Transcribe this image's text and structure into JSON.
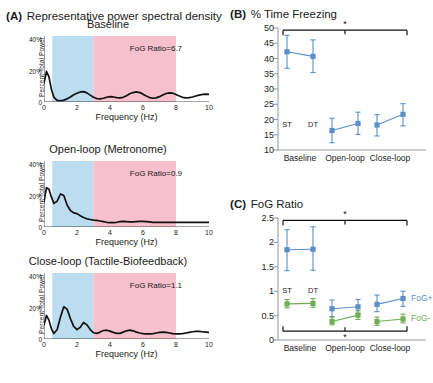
{
  "figure": {
    "panels": [
      "A",
      "B",
      "C"
    ]
  },
  "panelA": {
    "tag": "(A)",
    "title": "Representative power spectral density",
    "axis": {
      "xlabel": "Frequency (Hz)",
      "ylabel": "Percent Total Power",
      "xticks": [
        "0",
        "2",
        "4",
        "6",
        "8",
        "10"
      ],
      "yticks": [
        "0",
        "20%",
        "40%"
      ],
      "xlim": [
        0,
        10
      ],
      "ylim": [
        0,
        42
      ]
    },
    "bands": {
      "locomotor_color": "#bcdcf0",
      "freeze_color": "#f7c0cd",
      "locomotor_range": [
        0.5,
        3.0
      ],
      "freeze_range": [
        3.0,
        8.0
      ]
    },
    "plots": [
      {
        "title": "Baseline",
        "fog_label": "FoG Ratio=6.7",
        "fog_ratio": 6.7
      },
      {
        "title": "Open-loop (Metronome)",
        "fog_label": "FoG Ratio=0.9",
        "fog_ratio": 0.9
      },
      {
        "title": "Close-loop (Tactile-Biofeedback)",
        "fog_label": "FoG Ratio=1.1",
        "fog_ratio": 1.1
      }
    ]
  },
  "panelB": {
    "tag": "(B)",
    "title": "% Time Freezing",
    "significance_marker": "*"
  },
  "panelC": {
    "tag": "(C)",
    "title": "FoG Ratio",
    "significance_marker": "*",
    "legend": [
      {
        "label": "FoG+",
        "color": "#5b8fc9"
      },
      {
        "label": "FoG-",
        "color": "#6fae52"
      }
    ]
  },
  "chart_data": [
    {
      "id": "psd-baseline",
      "type": "line",
      "title": "Baseline",
      "xlabel": "Frequency (Hz)",
      "ylabel": "Percent Total Power",
      "xlim": [
        0,
        10
      ],
      "ylim": [
        0,
        42
      ],
      "xticks": [
        0,
        2,
        4,
        6,
        8,
        10
      ],
      "yticks": [
        0,
        20,
        40
      ],
      "ytick_labels": [
        "0",
        "20%",
        "40%"
      ],
      "grid": false,
      "annotations": [
        {
          "text": "FoG Ratio=6.7",
          "x": 5.2,
          "y": 34
        }
      ],
      "shaded_bands": [
        {
          "name": "locomotor",
          "x0": 0.5,
          "x1": 3.0,
          "color": "#bcdcf0"
        },
        {
          "name": "freeze",
          "x0": 3.0,
          "x1": 8.0,
          "color": "#f7c0cd"
        }
      ],
      "x": [
        0.0,
        0.15,
        0.3,
        0.45,
        0.6,
        0.8,
        1.0,
        1.2,
        1.4,
        1.6,
        1.8,
        2.0,
        2.2,
        2.4,
        2.6,
        2.8,
        3.0,
        3.2,
        3.4,
        3.6,
        3.8,
        4.0,
        4.2,
        4.4,
        4.6,
        4.8,
        5.0,
        5.2,
        5.4,
        5.6,
        5.8,
        6.0,
        6.2,
        6.4,
        6.6,
        6.8,
        7.0,
        7.2,
        7.4,
        7.6,
        7.8,
        8.0,
        8.2,
        8.4,
        8.6,
        8.8,
        9.0,
        9.2,
        9.4,
        9.6,
        9.8,
        10.0
      ],
      "y": [
        12.0,
        19.5,
        16.0,
        8.0,
        3.0,
        1.0,
        0.8,
        1.2,
        2.0,
        3.2,
        4.6,
        5.6,
        6.4,
        6.6,
        5.8,
        4.4,
        3.0,
        2.2,
        2.0,
        2.4,
        3.0,
        3.4,
        3.2,
        2.8,
        2.6,
        3.0,
        4.0,
        5.2,
        6.0,
        6.4,
        6.0,
        5.0,
        3.8,
        2.8,
        2.4,
        2.6,
        3.4,
        4.4,
        5.4,
        5.8,
        5.6,
        4.8,
        3.8,
        3.0,
        2.6,
        2.8,
        3.2,
        3.8,
        4.4,
        4.8,
        5.0,
        4.8
      ]
    },
    {
      "id": "psd-open-loop",
      "type": "line",
      "title": "Open-loop (Metronome)",
      "xlabel": "Frequency (Hz)",
      "ylabel": "Percent Total Power",
      "xlim": [
        0,
        10
      ],
      "ylim": [
        0,
        42
      ],
      "xticks": [
        0,
        2,
        4,
        6,
        8,
        10
      ],
      "yticks": [
        0,
        20,
        40
      ],
      "ytick_labels": [
        "0",
        "20%",
        "40%"
      ],
      "grid": false,
      "annotations": [
        {
          "text": "FoG Ratio=0.9",
          "x": 5.2,
          "y": 34
        }
      ],
      "shaded_bands": [
        {
          "name": "locomotor",
          "x0": 0.5,
          "x1": 3.0,
          "color": "#bcdcf0"
        },
        {
          "name": "freeze",
          "x0": 3.0,
          "x1": 8.0,
          "color": "#f7c0cd"
        }
      ],
      "x": [
        0.0,
        0.15,
        0.3,
        0.45,
        0.6,
        0.8,
        1.0,
        1.2,
        1.4,
        1.6,
        1.8,
        2.0,
        2.2,
        2.4,
        2.6,
        2.8,
        3.0,
        3.2,
        3.4,
        3.6,
        3.8,
        4.0,
        4.2,
        4.4,
        4.6,
        4.8,
        5.0,
        5.2,
        5.4,
        5.6,
        5.8,
        6.0,
        6.2,
        6.4,
        6.6,
        6.8,
        7.0,
        7.2,
        7.4,
        7.6,
        7.8,
        8.0,
        8.2,
        8.4,
        8.6,
        8.8,
        9.0,
        9.2,
        9.4,
        9.6,
        9.8,
        10.0
      ],
      "y": [
        16.0,
        25.0,
        24.0,
        19.0,
        15.0,
        16.5,
        21.0,
        20.0,
        14.0,
        10.5,
        9.0,
        8.5,
        7.2,
        6.0,
        5.2,
        4.8,
        4.4,
        4.2,
        3.8,
        3.4,
        3.0,
        2.8,
        2.8,
        3.0,
        3.4,
        3.6,
        3.4,
        3.2,
        3.2,
        3.4,
        3.6,
        3.6,
        3.4,
        3.2,
        3.0,
        3.0,
        3.0,
        3.0,
        3.0,
        3.0,
        3.0,
        3.0,
        3.0,
        3.0,
        3.0,
        3.0,
        3.0,
        3.0,
        3.0,
        3.0,
        3.0,
        3.0
      ]
    },
    {
      "id": "psd-close-loop",
      "type": "line",
      "title": "Close-loop (Tactile-Biofeedback)",
      "xlabel": "Frequency (Hz)",
      "ylabel": "Percent Total Power",
      "xlim": [
        0,
        10
      ],
      "ylim": [
        0,
        42
      ],
      "xticks": [
        0,
        2,
        4,
        6,
        8,
        10
      ],
      "yticks": [
        0,
        20,
        40
      ],
      "ytick_labels": [
        "0",
        "20%",
        "40%"
      ],
      "grid": false,
      "annotations": [
        {
          "text": "FoG Ratio=1.1",
          "x": 5.2,
          "y": 34
        }
      ],
      "shaded_bands": [
        {
          "name": "locomotor",
          "x0": 0.5,
          "x1": 3.0,
          "color": "#bcdcf0"
        },
        {
          "name": "freeze",
          "x0": 3.0,
          "x1": 8.0,
          "color": "#f7c0cd"
        }
      ],
      "x": [
        0.0,
        0.15,
        0.3,
        0.45,
        0.6,
        0.8,
        1.0,
        1.2,
        1.4,
        1.6,
        1.8,
        2.0,
        2.2,
        2.4,
        2.6,
        2.8,
        3.0,
        3.2,
        3.4,
        3.6,
        3.8,
        4.0,
        4.2,
        4.4,
        4.6,
        4.8,
        5.0,
        5.2,
        5.4,
        5.6,
        5.8,
        6.0,
        6.2,
        6.4,
        6.6,
        6.8,
        7.0,
        7.2,
        7.4,
        7.6,
        7.8,
        8.0,
        8.2,
        8.4,
        8.6,
        8.8,
        9.0,
        9.2,
        9.4,
        9.6,
        9.8,
        10.0
      ],
      "y": [
        9.0,
        15.0,
        12.0,
        6.5,
        3.5,
        6.0,
        14.0,
        20.5,
        19.0,
        13.0,
        8.0,
        6.0,
        7.5,
        10.5,
        9.0,
        6.0,
        4.0,
        3.6,
        4.4,
        5.4,
        5.6,
        5.0,
        4.2,
        3.6,
        3.6,
        4.4,
        5.2,
        5.6,
        5.2,
        4.4,
        3.8,
        3.4,
        3.2,
        3.2,
        3.4,
        3.8,
        4.2,
        4.4,
        4.2,
        3.8,
        3.4,
        3.2,
        3.2,
        3.4,
        3.8,
        4.2,
        4.6,
        4.8,
        4.8,
        4.6,
        4.4,
        4.2
      ]
    },
    {
      "id": "pct-time-freezing",
      "type": "line",
      "title": "% Time Freezing",
      "panel": "B",
      "xlabel": "",
      "ylabel": "",
      "ylim": [
        10,
        50
      ],
      "yticks": [
        10,
        15,
        20,
        25,
        30,
        35,
        40,
        45,
        50
      ],
      "categories": [
        "Baseline",
        "Open-loop",
        "Close-loop"
      ],
      "subcategories": [
        "ST",
        "DT"
      ],
      "grid": false,
      "legend_position": "none",
      "series": [
        {
          "name": "FoG+",
          "color": "#5b8fc9",
          "points": [
            {
              "category": "Baseline",
              "sub": "ST",
              "value": 42.2,
              "err_low": 36.8,
              "err_high": 47.6
            },
            {
              "category": "Baseline",
              "sub": "DT",
              "value": 40.7,
              "err_low": 35.4,
              "err_high": 46.1
            },
            {
              "category": "Open-loop",
              "sub": "ST",
              "value": 16.4,
              "err_low": 12.4,
              "err_high": 20.4
            },
            {
              "category": "Open-loop",
              "sub": "DT",
              "value": 18.7,
              "err_low": 15.1,
              "err_high": 22.4
            },
            {
              "category": "Close-loop",
              "sub": "ST",
              "value": 18.2,
              "err_low": 14.6,
              "err_high": 21.6
            },
            {
              "category": "Close-loop",
              "sub": "DT",
              "value": 21.7,
              "err_low": 17.9,
              "err_high": 25.2
            }
          ]
        }
      ],
      "significance": [
        {
          "marker": "*",
          "from": "Baseline",
          "to": "Close-loop",
          "y": 49.3,
          "position": "top"
        }
      ]
    },
    {
      "id": "fog-ratio",
      "type": "line",
      "title": "FoG Ratio",
      "panel": "C",
      "xlabel": "",
      "ylabel": "",
      "ylim": [
        0,
        2.5
      ],
      "yticks": [
        0,
        0.5,
        1,
        1.5,
        2,
        2.5
      ],
      "ytick_labels": [
        "0",
        "0.5",
        "1",
        "1.5",
        "2",
        "2.5"
      ],
      "categories": [
        "Baseline",
        "Open-loop",
        "Close-loop"
      ],
      "subcategories": [
        "ST",
        "DT"
      ],
      "grid": false,
      "legend_position": "right",
      "series": [
        {
          "name": "FoG+",
          "color": "#5b8fc9",
          "points": [
            {
              "category": "Baseline",
              "sub": "ST",
              "value": 1.85,
              "err_low": 1.42,
              "err_high": 2.26
            },
            {
              "category": "Baseline",
              "sub": "DT",
              "value": 1.86,
              "err_low": 1.43,
              "err_high": 2.32
            },
            {
              "category": "Open-loop",
              "sub": "ST",
              "value": 0.64,
              "err_low": 0.48,
              "err_high": 0.82
            },
            {
              "category": "Open-loop",
              "sub": "DT",
              "value": 0.68,
              "err_low": 0.54,
              "err_high": 0.83
            },
            {
              "category": "Close-loop",
              "sub": "ST",
              "value": 0.73,
              "err_low": 0.58,
              "err_high": 0.92
            },
            {
              "category": "Close-loop",
              "sub": "DT",
              "value": 0.85,
              "err_low": 0.69,
              "err_high": 1.0
            }
          ]
        },
        {
          "name": "FoG-",
          "color": "#6fae52",
          "points": [
            {
              "category": "Baseline",
              "sub": "ST",
              "value": 0.74,
              "err_low": 0.66,
              "err_high": 0.83
            },
            {
              "category": "Baseline",
              "sub": "DT",
              "value": 0.75,
              "err_low": 0.67,
              "err_high": 0.85
            },
            {
              "category": "Open-loop",
              "sub": "ST",
              "value": 0.38,
              "err_low": 0.31,
              "err_high": 0.47
            },
            {
              "category": "Open-loop",
              "sub": "DT",
              "value": 0.51,
              "err_low": 0.42,
              "err_high": 0.6
            },
            {
              "category": "Close-loop",
              "sub": "ST",
              "value": 0.38,
              "err_low": 0.3,
              "err_high": 0.47
            },
            {
              "category": "Close-loop",
              "sub": "DT",
              "value": 0.43,
              "err_low": 0.35,
              "err_high": 0.53
            }
          ]
        }
      ],
      "significance": [
        {
          "marker": "*",
          "from": "Baseline",
          "to": "Close-loop",
          "y": 2.45,
          "position": "top"
        },
        {
          "marker": "*",
          "from": "Baseline",
          "to": "Close-loop",
          "y": 0.18,
          "position": "bottom"
        }
      ]
    }
  ]
}
